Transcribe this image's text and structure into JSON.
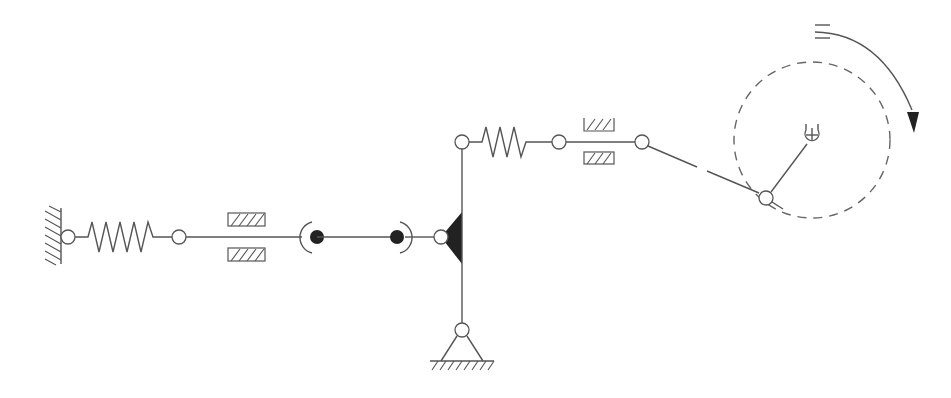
{
  "diagram": {
    "type": "mechanical-linkage-schematic",
    "colors": {
      "line": "#555555",
      "fill_dark": "#222222",
      "background": "#ffffff"
    },
    "components": [
      {
        "id": "fixed-wall-left",
        "kind": "fixed wall (hatched)"
      },
      {
        "id": "spring-left",
        "kind": "spring"
      },
      {
        "id": "damper-left",
        "kind": "damper / slide guide"
      },
      {
        "id": "cylindrical-joint-1",
        "kind": "spherical/cylindrical joint"
      },
      {
        "id": "cylindrical-joint-2",
        "kind": "spherical/cylindrical joint"
      },
      {
        "id": "bell-crank",
        "kind": "rigid bell crank (filled triangle)"
      },
      {
        "id": "ground-pivot",
        "kind": "pinned ground support"
      },
      {
        "id": "spring-upper",
        "kind": "spring"
      },
      {
        "id": "damper-upper",
        "kind": "damper / slide guide"
      },
      {
        "id": "connecting-rod",
        "kind": "connecting rod"
      },
      {
        "id": "crank",
        "kind": "rotating crank"
      },
      {
        "id": "crank-path",
        "kind": "dashed circular path"
      },
      {
        "id": "rotation-arrow",
        "kind": "clockwise rotation indicator"
      }
    ],
    "rotation_direction": "clockwise"
  }
}
